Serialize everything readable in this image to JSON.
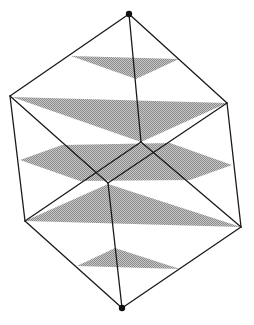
{
  "diagram": {
    "canvas": {
      "width": 254,
      "height": 325
    },
    "colors": {
      "background": "#ffffff",
      "edge": "#1a1a1a",
      "section_fill": "#a8a8a8",
      "vertex": "#111111"
    },
    "vertices": {
      "top": [
        129,
        14
      ],
      "upper_left": [
        10,
        96
      ],
      "upper_right": [
        227,
        103
      ],
      "center": [
        108,
        183
      ],
      "lower_left": [
        25,
        221
      ],
      "lower_right": [
        241,
        227
      ],
      "bottom": [
        122,
        308
      ],
      "hidden_back": [
        141,
        142
      ]
    },
    "edges": [
      [
        "top",
        "upper_left"
      ],
      [
        "top",
        "upper_right"
      ],
      [
        "top",
        "hidden_back"
      ],
      [
        "upper_left",
        "center"
      ],
      [
        "upper_right",
        "center"
      ],
      [
        "upper_left",
        "lower_left"
      ],
      [
        "upper_right",
        "lower_right"
      ],
      [
        "center",
        "bottom"
      ],
      [
        "lower_left",
        "bottom"
      ],
      [
        "lower_right",
        "bottom"
      ],
      [
        "hidden_back",
        "lower_left"
      ],
      [
        "hidden_back",
        "lower_right"
      ]
    ],
    "highlighted_vertices": [
      "top",
      "bottom"
    ],
    "sections": [
      {
        "name": "small-upper-triangle",
        "points": [
          [
            71,
            56
          ],
          [
            179,
            59
          ],
          [
            136,
            79
          ]
        ]
      },
      {
        "name": "large-upper-triangle",
        "points": [
          [
            12,
            97
          ],
          [
            227,
            103
          ],
          [
            141,
            142
          ]
        ]
      },
      {
        "name": "middle-hexagon",
        "points": [
          [
            20,
            160
          ],
          [
            62,
            145
          ],
          [
            170,
            143
          ],
          [
            232,
            165
          ],
          [
            190,
            180
          ],
          [
            80,
            181
          ]
        ]
      },
      {
        "name": "large-lower-triangle",
        "points": [
          [
            25,
            221
          ],
          [
            108,
            184
          ],
          [
            241,
            227
          ]
        ]
      },
      {
        "name": "small-lower-triangle",
        "points": [
          [
            77,
            266
          ],
          [
            115,
            248
          ],
          [
            180,
            269
          ]
        ]
      }
    ]
  }
}
